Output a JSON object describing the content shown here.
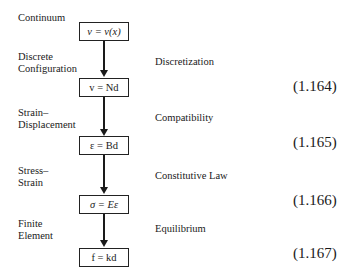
{
  "diagram": {
    "title_label": "Continuum",
    "boxes": [
      {
        "text": "v = v(x)"
      },
      {
        "text": "v = Nd"
      },
      {
        "text": "ε = Bd"
      },
      {
        "text": "σ = Eε"
      },
      {
        "text": "f = kd"
      }
    ],
    "left_labels": [
      "Discrete\nConfiguration",
      "Strain–\nDisplacement",
      "Stress–\nStrain",
      "Finite\nElement"
    ],
    "right_labels": [
      "Discretization",
      "Compatibility",
      "Constitutive Law",
      "Equilibrium"
    ],
    "equation_numbers": [
      "(1.164)",
      "(1.165)",
      "(1.166)",
      "(1.167)"
    ]
  }
}
